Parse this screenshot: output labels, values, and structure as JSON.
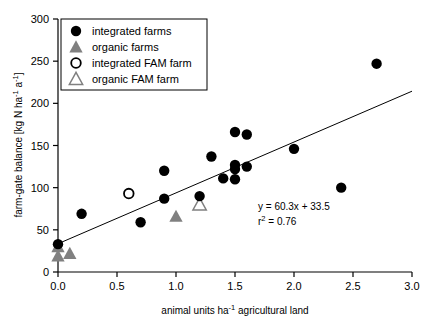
{
  "chart_data": {
    "type": "scatter",
    "title": "",
    "xlabel": "animal units ha-1 agricultural land",
    "xlabel_parts": {
      "pre": "animal units ha",
      "sup": "-1",
      "post": " agricultural land"
    },
    "ylabel": "farm-gate balance [kg N ha-1 a-1]",
    "ylabel_parts": {
      "p1": "farm-gate balance [kg N ha",
      "s1": "-1",
      "p2": " a",
      "s2": "-1",
      "p3": "]"
    },
    "xlim": [
      0.0,
      3.0
    ],
    "ylim": [
      0,
      300
    ],
    "xticks": [
      0.0,
      0.5,
      1.0,
      1.5,
      2.0,
      2.5,
      3.0
    ],
    "xtick_labels": [
      "0.0",
      "0.5",
      "1.0",
      "1.5",
      "2.0",
      "2.5",
      "3.0"
    ],
    "yticks": [
      0,
      50,
      100,
      150,
      200,
      250,
      300
    ],
    "ytick_labels": [
      "0",
      "50",
      "100",
      "150",
      "200",
      "250",
      "300"
    ],
    "grid": false,
    "legend_position": "upper-left",
    "series": [
      {
        "name": "integrated farms",
        "marker": "filled-circle",
        "color": "#000000",
        "points": [
          {
            "x": 0.0,
            "y": 33
          },
          {
            "x": 0.2,
            "y": 69
          },
          {
            "x": 0.7,
            "y": 59
          },
          {
            "x": 0.9,
            "y": 87
          },
          {
            "x": 0.9,
            "y": 120
          },
          {
            "x": 1.2,
            "y": 90
          },
          {
            "x": 1.3,
            "y": 137
          },
          {
            "x": 1.4,
            "y": 111
          },
          {
            "x": 1.5,
            "y": 110
          },
          {
            "x": 1.5,
            "y": 122
          },
          {
            "x": 1.5,
            "y": 127
          },
          {
            "x": 1.5,
            "y": 166
          },
          {
            "x": 1.6,
            "y": 125
          },
          {
            "x": 1.6,
            "y": 163
          },
          {
            "x": 2.0,
            "y": 146
          },
          {
            "x": 2.4,
            "y": 100
          },
          {
            "x": 2.7,
            "y": 247
          }
        ]
      },
      {
        "name": "organic farms",
        "marker": "filled-triangle",
        "color": "#808080",
        "points": [
          {
            "x": 0.0,
            "y": 19
          },
          {
            "x": 0.0,
            "y": 30
          },
          {
            "x": 0.1,
            "y": 22
          },
          {
            "x": 1.0,
            "y": 66
          }
        ]
      },
      {
        "name": "integrated FAM farm",
        "marker": "open-circle",
        "color": "#000000",
        "points": [
          {
            "x": 0.6,
            "y": 93
          }
        ]
      },
      {
        "name": "organic FAM farm",
        "marker": "open-triangle",
        "color": "#808080",
        "points": [
          {
            "x": 1.2,
            "y": 80
          }
        ]
      }
    ],
    "trendline": {
      "slope": 60.3,
      "intercept": 33.5,
      "x_start": 0.0,
      "x_end": 3.0,
      "color": "#000000"
    },
    "annotations": {
      "equation": "y = 60.3x + 33.5",
      "r_squared_parts": {
        "pre": "r",
        "sup": "2",
        "post": " = 0.76"
      },
      "r_squared": "r2 = 0.76"
    }
  },
  "legend": {
    "items": [
      {
        "label": "integrated farms",
        "marker": "filled-circle"
      },
      {
        "label": "organic farms",
        "marker": "filled-triangle"
      },
      {
        "label": "integrated FAM farm",
        "marker": "open-circle"
      },
      {
        "label": "organic FAM farm",
        "marker": "open-triangle"
      }
    ]
  },
  "colors": {
    "axis": "#000000",
    "marker_dark": "#000000",
    "marker_gray": "#808080",
    "background": "#ffffff"
  }
}
